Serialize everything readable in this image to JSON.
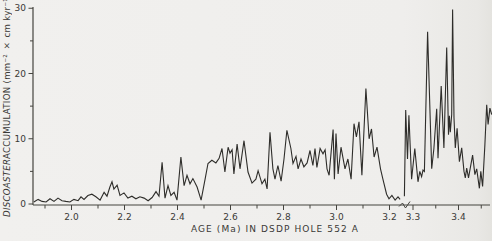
{
  "figure": {
    "ylabel_italic": "DISCOASTER",
    "ylabel_rest": " ACCUMULATION  (mm⁻² × cm kyr⁻¹)",
    "xlabel": "AGE (Ma) IN DSDP HOLE 552 A"
  },
  "chart_data": {
    "type": "line",
    "title": "",
    "xlabel": "AGE (Ma) IN DSDP HOLE 552 A",
    "ylabel": "DISCOASTER ACCUMULATION (mm⁻² × cm kyr⁻¹)",
    "line_color": "#2e2d2a",
    "axis_color": "#45443f",
    "background": "#f0efec",
    "grid": false,
    "legend": "none",
    "y_axis": {
      "label": "DISCOASTER ACCUMULATION (mm⁻² × cm kyr⁻¹)",
      "range": [
        0,
        30
      ],
      "major_ticks": [
        0,
        10,
        20,
        30
      ],
      "minor_ticks": [
        5,
        15,
        25
      ]
    },
    "x_axis": {
      "label": "AGE (Ma) IN DSDP HOLE 552 A",
      "unit": "Ma",
      "has_scale_break": true,
      "break_between": [
        3.25,
        3.28
      ],
      "segment_left": {
        "range": [
          1.855,
          3.25
        ],
        "px_per_ma": 265,
        "major_ticks": [
          2.0,
          2.2,
          2.4,
          2.6,
          2.8,
          3.0,
          3.2
        ],
        "minor_ticks": [
          1.9,
          2.1,
          2.3,
          2.5,
          2.7,
          2.9,
          3.1
        ]
      },
      "segment_right": {
        "range": [
          3.28,
          3.475
        ],
        "px_per_ma": 455,
        "major_ticks": [
          3.3,
          3.4
        ],
        "minor_ticks": [
          3.35,
          3.45
        ]
      }
    },
    "series": [
      {
        "name": "discoaster-accumulation-pre-break",
        "points": [
          [
            1.858,
            0.3
          ],
          [
            1.874,
            0.7
          ],
          [
            1.889,
            0.4
          ],
          [
            1.904,
            0.3
          ],
          [
            1.919,
            0.8
          ],
          [
            1.934,
            0.4
          ],
          [
            1.949,
            0.9
          ],
          [
            1.964,
            0.5
          ],
          [
            1.979,
            0.4
          ],
          [
            1.994,
            0.3
          ],
          [
            2.009,
            0.7
          ],
          [
            2.025,
            0.5
          ],
          [
            2.036,
            1.1
          ],
          [
            2.047,
            0.7
          ],
          [
            2.062,
            1.3
          ],
          [
            2.077,
            1.5
          ],
          [
            2.092,
            1.1
          ],
          [
            2.108,
            0.6
          ],
          [
            2.123,
            1.8
          ],
          [
            2.134,
            1.2
          ],
          [
            2.145,
            2.6
          ],
          [
            2.153,
            3.4
          ],
          [
            2.16,
            2.3
          ],
          [
            2.172,
            2.9
          ],
          [
            2.183,
            1.3
          ],
          [
            2.198,
            1.7
          ],
          [
            2.213,
            0.9
          ],
          [
            2.228,
            1.2
          ],
          [
            2.243,
            0.8
          ],
          [
            2.258,
            1.1
          ],
          [
            2.274,
            0.9
          ],
          [
            2.289,
            0.5
          ],
          [
            2.304,
            1.0
          ],
          [
            2.319,
            1.9
          ],
          [
            2.33,
            1.2
          ],
          [
            2.342,
            6.4
          ],
          [
            2.353,
            0.9
          ],
          [
            2.364,
            2.8
          ],
          [
            2.375,
            1.3
          ],
          [
            2.387,
            1.8
          ],
          [
            2.398,
            0.6
          ],
          [
            2.413,
            7.2
          ],
          [
            2.425,
            2.8
          ],
          [
            2.436,
            4.4
          ],
          [
            2.447,
            3.1
          ],
          [
            2.458,
            3.9
          ],
          [
            2.474,
            2.6
          ],
          [
            2.489,
            0.6
          ],
          [
            2.504,
            3.8
          ],
          [
            2.515,
            6.2
          ],
          [
            2.53,
            6.7
          ],
          [
            2.545,
            6.3
          ],
          [
            2.557,
            7.0
          ],
          [
            2.568,
            8.5
          ],
          [
            2.579,
            4.9
          ],
          [
            2.591,
            8.7
          ],
          [
            2.598,
            7.8
          ],
          [
            2.606,
            8.3
          ],
          [
            2.613,
            4.6
          ],
          [
            2.625,
            9.2
          ],
          [
            2.636,
            5.4
          ],
          [
            2.651,
            9.7
          ],
          [
            2.666,
            4.9
          ],
          [
            2.681,
            3.2
          ],
          [
            2.696,
            3.8
          ],
          [
            2.704,
            5.1
          ],
          [
            2.719,
            3.1
          ],
          [
            2.73,
            3.8
          ],
          [
            2.738,
            2.3
          ],
          [
            2.749,
            11.0
          ],
          [
            2.76,
            5.4
          ],
          [
            2.768,
            3.8
          ],
          [
            2.779,
            5.9
          ],
          [
            2.791,
            3.5
          ],
          [
            2.802,
            6.9
          ],
          [
            2.813,
            11.3
          ],
          [
            2.828,
            8.5
          ],
          [
            2.836,
            6.2
          ],
          [
            2.847,
            7.3
          ],
          [
            2.855,
            5.4
          ],
          [
            2.866,
            6.9
          ],
          [
            2.877,
            5.7
          ],
          [
            2.889,
            6.3
          ],
          [
            2.9,
            8.2
          ],
          [
            2.911,
            5.9
          ],
          [
            2.919,
            8.5
          ],
          [
            2.926,
            5.6
          ],
          [
            2.938,
            8.5
          ],
          [
            2.949,
            7.7
          ],
          [
            2.957,
            8.3
          ],
          [
            2.964,
            5.4
          ],
          [
            2.972,
            4.4
          ],
          [
            2.987,
            11.4
          ],
          [
            2.992,
            3.8
          ],
          [
            2.998,
            10.8
          ],
          [
            3.006,
            4.6
          ],
          [
            3.017,
            8.7
          ],
          [
            3.032,
            5.4
          ],
          [
            3.043,
            6.9
          ],
          [
            3.055,
            3.8
          ],
          [
            3.066,
            12.3
          ],
          [
            3.075,
            10.3
          ],
          [
            3.085,
            12.6
          ],
          [
            3.096,
            4.4
          ],
          [
            3.111,
            17.7
          ],
          [
            3.123,
            10.0
          ],
          [
            3.132,
            11.5
          ],
          [
            3.142,
            7.2
          ],
          [
            3.153,
            8.7
          ],
          [
            3.166,
            5.4
          ],
          [
            3.175,
            3.8
          ],
          [
            3.189,
            1.5
          ],
          [
            3.198,
            0.8
          ],
          [
            3.209,
            1.3
          ],
          [
            3.221,
            0.6
          ],
          [
            3.232,
            1.1
          ],
          [
            3.24,
            0.7
          ]
        ]
      },
      {
        "name": "discoaster-accumulation-post-break",
        "points": [
          [
            3.281,
            1.2
          ],
          [
            3.284,
            14.4
          ],
          [
            3.288,
            6.9
          ],
          [
            3.291,
            13.6
          ],
          [
            3.297,
            3.8
          ],
          [
            3.304,
            8.5
          ],
          [
            3.311,
            3.4
          ],
          [
            3.315,
            5.0
          ],
          [
            3.319,
            4.2
          ],
          [
            3.322,
            5.2
          ],
          [
            3.325,
            5.0
          ],
          [
            3.332,
            26.4
          ],
          [
            3.341,
            5.4
          ],
          [
            3.346,
            8.5
          ],
          [
            3.352,
            14.6
          ],
          [
            3.355,
            7.0
          ],
          [
            3.362,
            18.1
          ],
          [
            3.368,
            8.6
          ],
          [
            3.374,
            24.0
          ],
          [
            3.378,
            10.6
          ],
          [
            3.38,
            13.5
          ],
          [
            3.382,
            11.0
          ],
          [
            3.385,
            13.7
          ],
          [
            3.387,
            29.8
          ],
          [
            3.39,
            13.2
          ],
          [
            3.393,
            8.6
          ],
          [
            3.397,
            11.6
          ],
          [
            3.402,
            6.5
          ],
          [
            3.407,
            8.6
          ],
          [
            3.412,
            5.0
          ],
          [
            3.415,
            4.0
          ],
          [
            3.418,
            5.5
          ],
          [
            3.422,
            4.0
          ],
          [
            3.425,
            5.2
          ],
          [
            3.431,
            7.5
          ],
          [
            3.436,
            4.5
          ],
          [
            3.44,
            5.4
          ],
          [
            3.446,
            2.4
          ],
          [
            3.449,
            5.0
          ],
          [
            3.453,
            2.7
          ],
          [
            3.458,
            9.1
          ],
          [
            3.462,
            15.2
          ],
          [
            3.465,
            12.2
          ],
          [
            3.469,
            14.7
          ],
          [
            3.473,
            13.7
          ]
        ]
      }
    ]
  }
}
